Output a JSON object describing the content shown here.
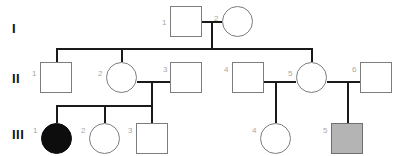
{
  "diagram": {
    "type": "pedigree-chart",
    "width": 400,
    "height": 156,
    "background": "#ffffff",
    "line_color": "#1a1a1a",
    "shape_stroke": "#7d7d7d",
    "id_label_color": "#a8a8a8",
    "generation_label_color": "#121212",
    "affected_solid_color": "#0d0d0d",
    "affected_gray_color": "#b4b4b4"
  },
  "generations": [
    {
      "key": "gen1",
      "label": "I"
    },
    {
      "key": "gen2",
      "label": "II"
    },
    {
      "key": "gen3",
      "label": "III"
    }
  ],
  "individuals": [
    {
      "key": "i1",
      "id": "1",
      "generation": "I",
      "sex": "male",
      "status": "unaffected"
    },
    {
      "key": "i2",
      "id": "2",
      "generation": "I",
      "sex": "female",
      "status": "unaffected"
    },
    {
      "key": "ii1",
      "id": "1",
      "generation": "II",
      "sex": "male",
      "status": "unaffected"
    },
    {
      "key": "ii2",
      "id": "2",
      "generation": "II",
      "sex": "female",
      "status": "unaffected"
    },
    {
      "key": "ii3",
      "id": "3",
      "generation": "II",
      "sex": "male",
      "status": "unaffected"
    },
    {
      "key": "ii4",
      "id": "4",
      "generation": "II",
      "sex": "male",
      "status": "unaffected"
    },
    {
      "key": "ii5",
      "id": "5",
      "generation": "II",
      "sex": "female",
      "status": "unaffected"
    },
    {
      "key": "ii6",
      "id": "6",
      "generation": "II",
      "sex": "male",
      "status": "unaffected"
    },
    {
      "key": "iii1",
      "id": "1",
      "generation": "III",
      "sex": "female",
      "status": "affected-solid"
    },
    {
      "key": "iii2",
      "id": "2",
      "generation": "III",
      "sex": "female",
      "status": "unaffected"
    },
    {
      "key": "iii3",
      "id": "3",
      "generation": "III",
      "sex": "male",
      "status": "unaffected"
    },
    {
      "key": "iii4",
      "id": "4",
      "generation": "III",
      "sex": "female",
      "status": "unaffected"
    },
    {
      "key": "iii5",
      "id": "5",
      "generation": "III",
      "sex": "male",
      "status": "affected-gray"
    }
  ],
  "matings": [
    {
      "key": "m1",
      "partners": [
        "i1",
        "i2"
      ],
      "children": [
        "ii1",
        "ii2",
        "ii5"
      ]
    },
    {
      "key": "m2",
      "partners": [
        "ii2",
        "ii3"
      ],
      "children": [
        "iii1",
        "iii2",
        "iii3"
      ]
    },
    {
      "key": "m3",
      "partners": [
        "ii4",
        "ii5"
      ],
      "children": [
        "iii4"
      ]
    },
    {
      "key": "m4",
      "partners": [
        "ii5",
        "ii6"
      ],
      "children": [
        "iii5"
      ]
    }
  ]
}
